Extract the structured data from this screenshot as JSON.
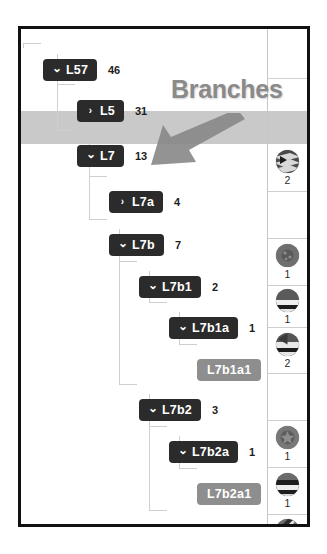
{
  "annotation": {
    "label": "Branches",
    "arrow_icon": "arrow-down-left-icon",
    "color": "#8a8a8a"
  },
  "colors": {
    "branch_node": "#2b2b2b",
    "leaf_node": "#8e8e8e",
    "highlight_row": "#c9c9c9",
    "frame": "#111111",
    "connector": "#cfcfcf"
  },
  "tree": {
    "nodes": [
      {
        "id": "L57",
        "label": "L57",
        "count": "46",
        "type": "branch",
        "expanded": true,
        "chevron": "chevron-down-icon",
        "depth": 0,
        "x": 22,
        "y": 30,
        "selected": false
      },
      {
        "id": "L5",
        "label": "L5",
        "count": "31",
        "type": "branch",
        "expanded": false,
        "chevron": "chevron-right-icon",
        "depth": 1,
        "x": 56,
        "y": 71,
        "selected": false
      },
      {
        "id": "L7",
        "label": "L7",
        "count": "13",
        "type": "branch",
        "expanded": true,
        "chevron": "chevron-down-icon",
        "depth": 1,
        "x": 56,
        "y": 116,
        "selected": true
      },
      {
        "id": "L7a",
        "label": "L7a",
        "count": "4",
        "type": "branch",
        "expanded": false,
        "chevron": "chevron-right-icon",
        "depth": 2,
        "x": 88,
        "y": 162,
        "selected": false
      },
      {
        "id": "L7b",
        "label": "L7b",
        "count": "7",
        "type": "branch",
        "expanded": true,
        "chevron": "chevron-down-icon",
        "depth": 2,
        "x": 88,
        "y": 205,
        "selected": false
      },
      {
        "id": "L7b1",
        "label": "L7b1",
        "count": "2",
        "type": "branch",
        "expanded": true,
        "chevron": "chevron-down-icon",
        "depth": 3,
        "x": 118,
        "y": 247,
        "selected": false
      },
      {
        "id": "L7b1a",
        "label": "L7b1a",
        "count": "1",
        "type": "branch",
        "expanded": true,
        "chevron": "chevron-down-icon",
        "depth": 4,
        "x": 148,
        "y": 288,
        "selected": false
      },
      {
        "id": "L7b1a1",
        "label": "L7b1a1",
        "count": "",
        "type": "leaf",
        "expanded": false,
        "chevron": "",
        "depth": 5,
        "x": 176,
        "y": 330,
        "selected": false
      },
      {
        "id": "L7b2",
        "label": "L7b2",
        "count": "3",
        "type": "branch",
        "expanded": true,
        "chevron": "chevron-down-icon",
        "depth": 3,
        "x": 118,
        "y": 370,
        "selected": false
      },
      {
        "id": "L7b2a",
        "label": "L7b2a",
        "count": "1",
        "type": "branch",
        "expanded": true,
        "chevron": "chevron-down-icon",
        "depth": 4,
        "x": 148,
        "y": 412,
        "selected": false
      },
      {
        "id": "L7b2a1",
        "label": "L7b2a1",
        "count": "",
        "type": "leaf",
        "expanded": false,
        "chevron": "",
        "depth": 5,
        "x": 176,
        "y": 454,
        "selected": false
      },
      {
        "id": "L7b2b",
        "label": "L7b2b",
        "count": "",
        "type": "leaf",
        "expanded": false,
        "chevron": "",
        "depth": 4,
        "x": 146,
        "y": 496,
        "selected": false
      }
    ]
  },
  "icon_column": {
    "cells": [
      {
        "icon": "striped-sphere-icon",
        "pattern": "chevron-stripes",
        "count": "2",
        "top": 115,
        "height": 48
      },
      {
        "icon": "empty-cell-icon",
        "pattern": "none",
        "count": "",
        "top": 163,
        "height": 47
      },
      {
        "icon": "textured-sphere-icon",
        "pattern": "speckled",
        "count": "1",
        "top": 210,
        "height": 47
      },
      {
        "icon": "half-band-sphere-icon",
        "pattern": "lower-band",
        "count": "1",
        "top": 257,
        "height": 42
      },
      {
        "icon": "quarter-band-sphere-icon",
        "pattern": "mid-bands",
        "count": "2",
        "top": 299,
        "height": 46
      },
      {
        "icon": "empty-cell-icon",
        "pattern": "none",
        "count": "",
        "top": 345,
        "height": 47
      },
      {
        "icon": "star-sphere-icon",
        "pattern": "star",
        "count": "1",
        "top": 392,
        "height": 47
      },
      {
        "icon": "triple-band-sphere-icon",
        "pattern": "triple-band",
        "count": "1",
        "top": 439,
        "height": 47
      },
      {
        "icon": "diagonal-slash-sphere-icon",
        "pattern": "diagonal",
        "count": "4",
        "top": 486,
        "height": 44
      }
    ]
  }
}
